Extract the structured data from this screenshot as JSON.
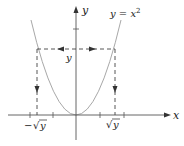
{
  "diagram": {
    "curve_label": {
      "lhs": "y",
      "eq": " = ",
      "rhs": "x",
      "exp": "2"
    },
    "axes": {
      "x_label": "x",
      "y_label": "y"
    },
    "annotations": {
      "level_label": "y",
      "neg_root_minus": "−",
      "neg_root_radical": "√",
      "neg_root_var": "y",
      "pos_root_radical": "√",
      "pos_root_var": "y"
    },
    "colors": {
      "curve": "#a8a8a8",
      "axes": "#555555",
      "dashed": "#444444",
      "text": "#222222"
    }
  }
}
